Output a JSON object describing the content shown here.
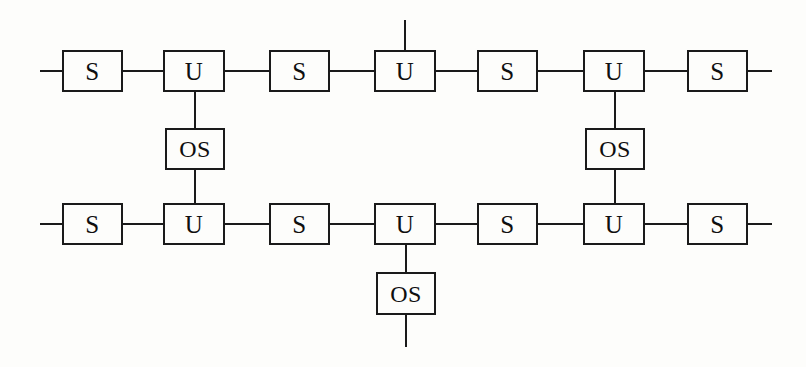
{
  "diagram": {
    "background_color": "#fdfdfb",
    "line_color": "#1a1a1a",
    "text_color": "#0f0f0f",
    "labels": {
      "s": "S",
      "u": "U",
      "os": "OS"
    },
    "nodes": [
      {
        "id": "top-s-1",
        "label": "S",
        "kind": "s",
        "row": "top",
        "x": 62,
        "y": 50,
        "w": 61,
        "h": 42
      },
      {
        "id": "top-u-1",
        "label": "U",
        "kind": "u",
        "row": "top",
        "x": 163,
        "y": 50,
        "w": 62,
        "h": 42
      },
      {
        "id": "top-s-2",
        "label": "S",
        "kind": "s",
        "row": "top",
        "x": 269,
        "y": 50,
        "w": 61,
        "h": 42
      },
      {
        "id": "top-u-2",
        "label": "U",
        "kind": "u",
        "row": "top",
        "x": 374,
        "y": 50,
        "w": 62,
        "h": 42
      },
      {
        "id": "top-s-3",
        "label": "S",
        "kind": "s",
        "row": "top",
        "x": 477,
        "y": 50,
        "w": 61,
        "h": 42
      },
      {
        "id": "top-u-3",
        "label": "U",
        "kind": "u",
        "row": "top",
        "x": 583,
        "y": 50,
        "w": 62,
        "h": 42
      },
      {
        "id": "top-s-4",
        "label": "S",
        "kind": "s",
        "row": "top",
        "x": 687,
        "y": 50,
        "w": 61,
        "h": 42
      },
      {
        "id": "mid-os-l",
        "label": "OS",
        "kind": "os",
        "row": "middle",
        "x": 165,
        "y": 128,
        "w": 60,
        "h": 42
      },
      {
        "id": "mid-os-r",
        "label": "OS",
        "kind": "os",
        "row": "middle",
        "x": 585,
        "y": 128,
        "w": 60,
        "h": 42
      },
      {
        "id": "bot-s-1",
        "label": "S",
        "kind": "s",
        "row": "bottom",
        "x": 62,
        "y": 203,
        "w": 61,
        "h": 42
      },
      {
        "id": "bot-u-1",
        "label": "U",
        "kind": "u",
        "row": "bottom",
        "x": 163,
        "y": 203,
        "w": 62,
        "h": 42
      },
      {
        "id": "bot-s-2",
        "label": "S",
        "kind": "s",
        "row": "bottom",
        "x": 269,
        "y": 203,
        "w": 61,
        "h": 42
      },
      {
        "id": "bot-u-2",
        "label": "U",
        "kind": "u",
        "row": "bottom",
        "x": 374,
        "y": 203,
        "w": 62,
        "h": 42
      },
      {
        "id": "bot-s-3",
        "label": "S",
        "kind": "s",
        "row": "bottom",
        "x": 477,
        "y": 203,
        "w": 61,
        "h": 42
      },
      {
        "id": "bot-u-3",
        "label": "U",
        "kind": "u",
        "row": "bottom",
        "x": 583,
        "y": 203,
        "w": 62,
        "h": 42
      },
      {
        "id": "bot-s-4",
        "label": "S",
        "kind": "s",
        "row": "bottom",
        "x": 687,
        "y": 203,
        "w": 61,
        "h": 42
      },
      {
        "id": "bot-os-c",
        "label": "OS",
        "kind": "os",
        "row": "lower",
        "x": 376,
        "y": 272,
        "w": 60,
        "h": 43
      }
    ],
    "links": [
      {
        "id": "top-stub-left",
        "orient": "h",
        "x": 40,
        "y": 70,
        "len": 23
      },
      {
        "id": "top-s1-u1",
        "orient": "h",
        "x": 122,
        "y": 70,
        "len": 42
      },
      {
        "id": "top-u1-s2",
        "orient": "h",
        "x": 224,
        "y": 70,
        "len": 46
      },
      {
        "id": "top-s2-u2",
        "orient": "h",
        "x": 329,
        "y": 70,
        "len": 46
      },
      {
        "id": "top-u2-s3",
        "orient": "h",
        "x": 435,
        "y": 70,
        "len": 43
      },
      {
        "id": "top-s3-u3",
        "orient": "h",
        "x": 537,
        "y": 70,
        "len": 47
      },
      {
        "id": "top-u3-s4",
        "orient": "h",
        "x": 644,
        "y": 70,
        "len": 44
      },
      {
        "id": "top-stub-right",
        "orient": "h",
        "x": 747,
        "y": 70,
        "len": 25
      },
      {
        "id": "bot-stub-left",
        "orient": "h",
        "x": 40,
        "y": 223,
        "len": 23
      },
      {
        "id": "bot-s1-u1",
        "orient": "h",
        "x": 122,
        "y": 223,
        "len": 42
      },
      {
        "id": "bot-u1-s2",
        "orient": "h",
        "x": 224,
        "y": 223,
        "len": 46
      },
      {
        "id": "bot-s2-u2",
        "orient": "h",
        "x": 329,
        "y": 223,
        "len": 46
      },
      {
        "id": "bot-u2-s3",
        "orient": "h",
        "x": 435,
        "y": 223,
        "len": 43
      },
      {
        "id": "bot-s3-u3",
        "orient": "h",
        "x": 537,
        "y": 223,
        "len": 47
      },
      {
        "id": "bot-u3-s4",
        "orient": "h",
        "x": 644,
        "y": 223,
        "len": 44
      },
      {
        "id": "bot-stub-right",
        "orient": "h",
        "x": 747,
        "y": 223,
        "len": 25
      },
      {
        "id": "up-stub-u2",
        "orient": "v",
        "x": 404,
        "y": 20,
        "len": 31
      },
      {
        "id": "left-u-to-os",
        "orient": "v",
        "x": 194,
        "y": 91,
        "len": 38
      },
      {
        "id": "left-os-to-u",
        "orient": "v",
        "x": 194,
        "y": 169,
        "len": 35
      },
      {
        "id": "right-u-to-os",
        "orient": "v",
        "x": 614,
        "y": 91,
        "len": 38
      },
      {
        "id": "right-os-to-u",
        "orient": "v",
        "x": 614,
        "y": 169,
        "len": 35
      },
      {
        "id": "bot-u-to-os",
        "orient": "v",
        "x": 405,
        "y": 244,
        "len": 29
      },
      {
        "id": "down-stub-os",
        "orient": "v",
        "x": 405,
        "y": 314,
        "len": 33
      }
    ]
  }
}
